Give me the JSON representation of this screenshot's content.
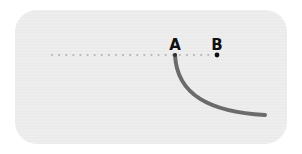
{
  "diagram": {
    "type": "geometry-curve",
    "background_color": "#ebebeb",
    "dotted_line": {
      "x_start": 52,
      "x_end": 214,
      "y": 55,
      "color": "#b8b8b8",
      "dot_spacing": 7
    },
    "points": [
      {
        "id": "A",
        "label": "A",
        "x": 175,
        "y": 55,
        "label_x": 175,
        "label_y": 50
      },
      {
        "id": "B",
        "label": "B",
        "x": 217,
        "y": 55,
        "label_x": 217,
        "label_y": 50
      }
    ],
    "curve": {
      "start": [
        175,
        55
      ],
      "end": [
        265,
        115
      ],
      "color": "#6b6b6b",
      "stroke_width": 4
    }
  }
}
